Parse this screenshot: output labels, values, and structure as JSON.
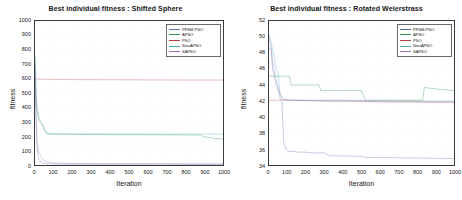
{
  "figure": {
    "axis_label_y": "fitness",
    "axis_label_x": "Iteration"
  },
  "panels": [
    {
      "name": "shifted-sphere",
      "title": "Best individual fitness : Shifted Sphere",
      "legend_position": "top-right"
    },
    {
      "name": "rotated-weierstrass",
      "title": "Best individual fitness : Rotated Weierstrass",
      "legend_position": "top-right"
    }
  ],
  "series_colors": {
    "PFSM-PSO": "#4f6fa8",
    "APSO": "#2f8f4f",
    "PSO": "#b5453f",
    "SinuAPSO": "#49a6c0",
    "SAPSO": "#9a6fbd"
  },
  "chart_data": [
    {
      "type": "line",
      "title": "Best individual fitness : Shifted Sphere",
      "xlabel": "Iteration",
      "ylabel": "fitness",
      "xlim": [
        0,
        1000
      ],
      "ylim": [
        0,
        1000
      ],
      "xticks": [
        0,
        100,
        200,
        300,
        400,
        500,
        600,
        700,
        800,
        900,
        1000
      ],
      "yticks": [
        0,
        100,
        200,
        300,
        400,
        500,
        600,
        700,
        800,
        900,
        1000
      ],
      "grid": true,
      "legend": [
        "PFSM-PSO",
        "APSO",
        "PSO",
        "SinuAPSO",
        "SAPSO"
      ],
      "legend_position": "upper right",
      "series": [
        {
          "name": "PFSM-PSO",
          "color": "#4f6fa8",
          "x": [
            0,
            5,
            10,
            15,
            20,
            30,
            40,
            50,
            60,
            80,
            100,
            150,
            200,
            300,
            400,
            500,
            600,
            700,
            800,
            900,
            1000
          ],
          "values": [
            690,
            330,
            140,
            70,
            42,
            22,
            15,
            11,
            9,
            8,
            7,
            6,
            6,
            5,
            5,
            5,
            5,
            5,
            4,
            4,
            4
          ]
        },
        {
          "name": "APSO",
          "color": "#2f8f4f",
          "x": [
            0,
            5,
            10,
            20,
            30,
            40,
            50,
            60,
            70,
            80,
            100,
            200,
            400,
            600,
            800,
            880,
            900,
            950,
            1000
          ],
          "values": [
            760,
            520,
            400,
            330,
            300,
            285,
            250,
            222,
            216,
            214,
            213,
            212,
            211,
            210,
            209,
            208,
            196,
            186,
            181
          ]
        },
        {
          "name": "PSO",
          "color": "#b5453f",
          "x": [
            0,
            10,
            30,
            60,
            100,
            200,
            400,
            600,
            800,
            1000
          ],
          "values": [
            600,
            598,
            596,
            595,
            594,
            593,
            592,
            591,
            590,
            590
          ]
        },
        {
          "name": "SinuAPSO",
          "color": "#49a6c0",
          "x": [
            0,
            5,
            10,
            20,
            30,
            40,
            50,
            60,
            80,
            100,
            200,
            400,
            600,
            800,
            1000
          ],
          "values": [
            740,
            500,
            380,
            310,
            290,
            270,
            240,
            224,
            219,
            218,
            217,
            216,
            215,
            215,
            214
          ]
        },
        {
          "name": "SAPSO",
          "color": "#9a6fbd",
          "x": [
            0,
            5,
            10,
            20,
            40,
            60,
            100,
            200,
            400,
            600,
            800,
            1000
          ],
          "values": [
            700,
            380,
            180,
            90,
            40,
            22,
            14,
            11,
            10,
            9,
            9,
            8
          ]
        }
      ]
    },
    {
      "type": "line",
      "title": "Best individual fitness : Rotated Weierstrass",
      "xlabel": "Iteration",
      "ylabel": "fitness",
      "xlim": [
        0,
        1000
      ],
      "ylim": [
        34,
        52
      ],
      "xticks": [
        0,
        100,
        200,
        300,
        400,
        500,
        600,
        700,
        800,
        900,
        1000
      ],
      "yticks": [
        34,
        36,
        38,
        40,
        42,
        44,
        46,
        48,
        50,
        52
      ],
      "grid": true,
      "legend": [
        "PFSM-PSO",
        "APSO",
        "PSO",
        "SinuAPSO",
        "SAPSO"
      ],
      "legend_position": "upper right",
      "series": [
        {
          "name": "PFSM-PSO",
          "color": "#4f6fa8",
          "x": [
            0,
            10,
            20,
            30,
            40,
            55,
            60,
            70,
            75,
            80,
            90,
            100,
            110,
            130,
            160,
            200,
            250,
            300,
            320,
            340,
            500,
            520,
            700,
            850,
            1000
          ],
          "values": [
            48.6,
            48.6,
            46.0,
            44.9,
            44.0,
            43.0,
            42.3,
            41.9,
            39.0,
            36.8,
            36.1,
            35.8,
            35.7,
            35.7,
            35.6,
            35.6,
            35.5,
            35.5,
            35.2,
            35.15,
            35.1,
            34.95,
            34.9,
            34.85,
            34.8
          ]
        },
        {
          "name": "APSO",
          "color": "#2f8f4f",
          "x": [
            0,
            40,
            60,
            80,
            100,
            110,
            120,
            200,
            270,
            280,
            380,
            400,
            500,
            520,
            700,
            830,
            840,
            900,
            1000
          ],
          "values": [
            45.1,
            45.1,
            45.1,
            45.1,
            45.1,
            45.1,
            44.0,
            44.0,
            44.0,
            43.3,
            43.3,
            43.3,
            43.3,
            42.1,
            42.1,
            42.1,
            43.7,
            43.5,
            43.3
          ]
        },
        {
          "name": "PSO",
          "color": "#b5453f",
          "x": [
            0,
            100,
            200,
            300,
            400,
            500,
            600,
            700,
            800,
            900,
            1000
          ],
          "values": [
            42.1,
            42.1,
            42.05,
            42.0,
            42.0,
            41.95,
            41.9,
            41.9,
            41.9,
            41.85,
            41.85
          ]
        },
        {
          "name": "SinuAPSO",
          "color": "#49a6c0",
          "x": [
            0,
            10,
            20,
            30,
            40,
            50,
            55,
            60,
            70,
            80,
            90,
            100,
            200,
            400,
            600,
            800,
            1000
          ],
          "values": [
            50.3,
            49.6,
            48.2,
            47.2,
            46.0,
            45.4,
            44.0,
            43.0,
            42.4,
            42.2,
            42.2,
            42.15,
            42.1,
            42.1,
            42.05,
            42.0,
            42.0
          ]
        },
        {
          "name": "SAPSO",
          "color": "#9a6fbd",
          "x": [
            0,
            10,
            20,
            30,
            40,
            50,
            60,
            70,
            80,
            90,
            100,
            120,
            150,
            200,
            300,
            400,
            500,
            520,
            700,
            1000
          ],
          "values": [
            49.9,
            48.8,
            47.0,
            45.6,
            44.6,
            43.6,
            42.8,
            42.35,
            42.2,
            42.15,
            42.1,
            42.1,
            42.05,
            42.05,
            42.0,
            42.0,
            42.0,
            41.95,
            41.9,
            41.85
          ]
        }
      ]
    }
  ]
}
